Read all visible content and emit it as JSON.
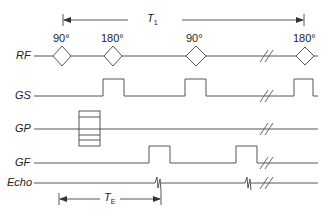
{
  "diagram": {
    "rows": [
      {
        "id": "rf",
        "label": "RF"
      },
      {
        "id": "gs",
        "label": "GS"
      },
      {
        "id": "gp",
        "label": "GP"
      },
      {
        "id": "gf",
        "label": "GF"
      },
      {
        "id": "echo",
        "label": "Echo"
      }
    ],
    "rf_pulses": [
      {
        "angle": "90°"
      },
      {
        "angle": "180°"
      },
      {
        "angle": "90°"
      },
      {
        "angle": "180°"
      }
    ],
    "intervals": {
      "repetition": {
        "symbol": "T",
        "subscript": "1"
      },
      "echo": {
        "symbol": "T",
        "subscript": "E"
      }
    },
    "colors": {
      "line": "#555555",
      "text": "#222222"
    }
  }
}
